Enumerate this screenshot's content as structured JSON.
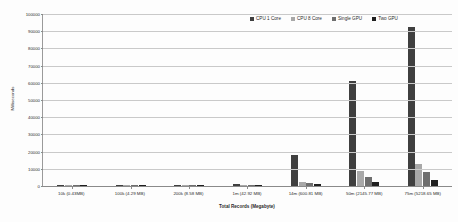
{
  "chart_data": {
    "type": "bar",
    "title": "",
    "xlabel": "Total Records (Megabyte)",
    "ylabel": "Milliseconds",
    "ylim": [
      0,
      100000
    ],
    "ytick_step": 10000,
    "yticks": [
      "0",
      "10000",
      "20000",
      "30000",
      "40000",
      "50000",
      "60000",
      "70000",
      "80000",
      "90000",
      "100000"
    ],
    "grid": true,
    "legend_position": "top-right",
    "categories": [
      "10k (0.43MB)",
      "100k (4.29 MB)",
      "200k (8.58 MB)",
      "1m (42.92 MB)",
      "14m (600.81 MB)",
      "50m (2145.77 MB)",
      "75m (5218.65 MB)"
    ],
    "series": [
      {
        "name": "CPU 1 Core",
        "color": "#3f3f3f",
        "values": [
          180,
          420,
          780,
          1450,
          18000,
          61000,
          92500
        ]
      },
      {
        "name": "CPU 8 Core",
        "color": "#a8a8a8",
        "values": [
          60,
          120,
          200,
          420,
          2200,
          9000,
          13000
        ]
      },
      {
        "name": "Single GPU",
        "color": "#6e6e6e",
        "values": [
          40,
          90,
          150,
          300,
          1500,
          5500,
          8000
        ]
      },
      {
        "name": "Two GPU",
        "color": "#1f1f1f",
        "values": [
          30,
          60,
          110,
          220,
          900,
          2500,
          3500
        ]
      }
    ]
  },
  "legend": {
    "items": [
      {
        "label": "CPU 1 Core",
        "color": "#3f3f3f"
      },
      {
        "label": "CPU 8 Core",
        "color": "#a8a8a8"
      },
      {
        "label": "Single GPU",
        "color": "#6e6e6e"
      },
      {
        "label": "Two GPU",
        "color": "#1f1f1f"
      }
    ]
  }
}
